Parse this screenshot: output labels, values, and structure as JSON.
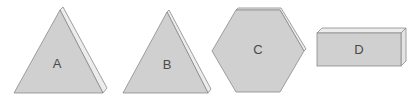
{
  "shapes": [
    {
      "id": "A",
      "label": "A",
      "type": "triangle-prism"
    },
    {
      "id": "B",
      "label": "B",
      "type": "triangle-prism"
    },
    {
      "id": "C",
      "label": "C",
      "type": "hexagonal-prism"
    },
    {
      "id": "D",
      "label": "D",
      "type": "rectangular-prism"
    }
  ],
  "colors": {
    "face": "#d0d0d0",
    "side": "#ececec",
    "outline": "#8a8a8a",
    "label": "#4a4a4a"
  }
}
